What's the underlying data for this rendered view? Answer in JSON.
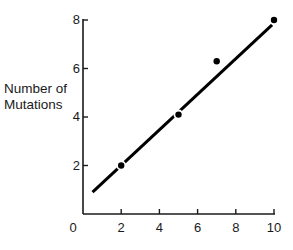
{
  "chart_data": {
    "type": "scatter",
    "title": "",
    "xlabel": "",
    "ylabel": "Number of Mutations",
    "ylabel_lines": [
      "Number of",
      "Mutations"
    ],
    "xlim": [
      0,
      10
    ],
    "ylim": [
      0,
      8
    ],
    "x_ticks": [
      0,
      2,
      4,
      6,
      8,
      10
    ],
    "y_ticks": [
      2,
      4,
      6,
      8
    ],
    "x_tick_labels": [
      "0",
      "2",
      "4",
      "6",
      "8",
      "10"
    ],
    "y_tick_labels": [
      "2",
      "4",
      "6",
      "8"
    ],
    "grid": false,
    "legend": null,
    "series": [
      {
        "name": "observed",
        "kind": "points",
        "x": [
          2,
          5,
          7,
          10
        ],
        "y": [
          2.0,
          4.1,
          6.3,
          8.0
        ]
      },
      {
        "name": "fit line",
        "kind": "line",
        "x": [
          0.5,
          9.9
        ],
        "y": [
          0.9,
          7.8
        ]
      }
    ],
    "colors": {
      "axis": "#1a1a1a",
      "points": "#000000",
      "line": "#000000"
    }
  }
}
